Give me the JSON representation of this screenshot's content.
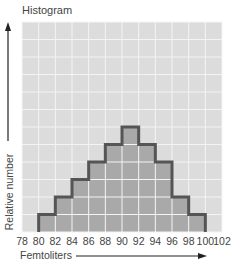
{
  "chart_data": {
    "type": "bar",
    "title": "Histogram",
    "xlabel": "Femtoliters",
    "ylabel": "Relative number",
    "x_ticks": [
      "78",
      "80",
      "82",
      "84",
      "86",
      "88",
      "90",
      "92",
      "94",
      "96",
      "98",
      "100",
      "102"
    ],
    "categories": [
      "80-82",
      "82-84",
      "84-86",
      "86-88",
      "88-90",
      "90-92",
      "92-94",
      "94-96",
      "96-98",
      "98-100"
    ],
    "values": [
      1,
      2,
      3,
      4,
      5,
      6,
      5,
      4,
      2,
      1
    ],
    "xlim": [
      78,
      102
    ],
    "ylim": [
      0,
      12
    ],
    "grid": true,
    "legend": null,
    "colors": {
      "background": "#dcdcdc",
      "grid": "#f4f4f4",
      "bars": "#a9a9a9",
      "outline": "#555555"
    }
  }
}
